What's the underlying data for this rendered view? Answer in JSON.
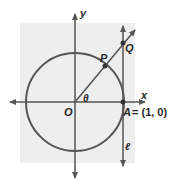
{
  "diagram": {
    "background_color": "#eeeeee",
    "stroke_color": "#555555",
    "labels": {
      "y_axis": "y",
      "x_axis": "x",
      "origin": "O",
      "angle": "θ",
      "point_p": "P",
      "point_q": "Q",
      "point_a": "A",
      "point_a_coords": "= (1, 0)",
      "tangent_line": "ℓ"
    },
    "elements": [
      {
        "type": "axis",
        "name": "x-axis"
      },
      {
        "type": "axis",
        "name": "y-axis"
      },
      {
        "type": "circle",
        "name": "unit-circle",
        "center": "O",
        "radius": 1
      },
      {
        "type": "ray",
        "name": "terminal-ray",
        "from": "O",
        "through": [
          "P",
          "Q"
        ]
      },
      {
        "type": "line",
        "name": "tangent-line-l",
        "through": [
          "A",
          "Q"
        ],
        "vertical": true
      },
      {
        "type": "point",
        "name": "P",
        "on": "unit-circle"
      },
      {
        "type": "point",
        "name": "Q",
        "on": "tangent-line-l"
      },
      {
        "type": "point",
        "name": "A",
        "coords": [
          1,
          0
        ]
      }
    ]
  }
}
